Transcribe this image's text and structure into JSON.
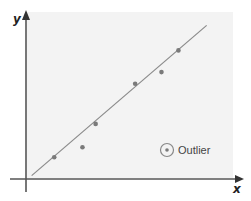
{
  "chart_data": {
    "type": "scatter",
    "title": "",
    "xlabel": "x",
    "ylabel": "y",
    "grid": false,
    "ticks": "none",
    "points": [
      {
        "x": 1.5,
        "y": 1.3
      },
      {
        "x": 3.0,
        "y": 1.9
      },
      {
        "x": 3.7,
        "y": 3.3
      },
      {
        "x": 5.8,
        "y": 5.7
      },
      {
        "x": 7.2,
        "y": 6.4
      },
      {
        "x": 8.1,
        "y": 7.7
      }
    ],
    "trend_line": {
      "x0": 0.3,
      "y0": 0.2,
      "x1": 9.6,
      "y1": 9.2
    },
    "xlim": [
      0,
      11
    ],
    "ylim": [
      0,
      10
    ],
    "legend": {
      "position": "lower-right",
      "entries": [
        {
          "label": "Outlier",
          "marker": "circled-dot"
        }
      ]
    },
    "colors": {
      "points": "#7a7a7a",
      "line": "#8a8a8a",
      "axes": "#555555",
      "panel": "#f3f3f3"
    }
  },
  "labels": {
    "x_axis": "x",
    "y_axis": "y",
    "legend_outlier": "Outlier"
  }
}
